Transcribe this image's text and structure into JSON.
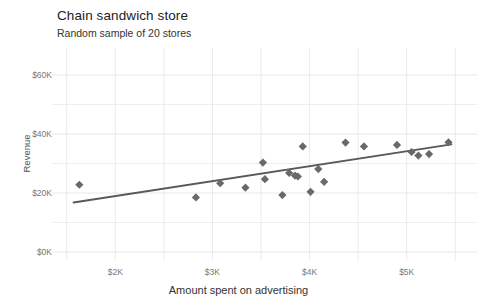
{
  "chart_data": {
    "type": "scatter",
    "title": "Chain sandwich store",
    "subtitle": "Random sample of 20 stores",
    "xlabel": "Amount spent on advertising",
    "ylabel": "Revenue",
    "xlim": [
      1400,
      5600
    ],
    "ylim": [
      0,
      60000
    ],
    "grid": true,
    "legend": false,
    "xticks": [
      2000,
      3000,
      4000,
      5000
    ],
    "xticklabels": [
      "$2K",
      "$3K",
      "$4K",
      "$5K"
    ],
    "yticks": [
      0,
      20000,
      40000,
      60000
    ],
    "yticklabels": [
      "$0K",
      "$20K",
      "$40K",
      "$60K"
    ],
    "marker": "diamond",
    "marker_color": "#696969",
    "line_color": "#595959",
    "grid_color": "#e8e8e8",
    "points": [
      {
        "x": 1630,
        "y": 22800
      },
      {
        "x": 2830,
        "y": 18500
      },
      {
        "x": 3080,
        "y": 23300
      },
      {
        "x": 3340,
        "y": 21800
      },
      {
        "x": 3520,
        "y": 30300
      },
      {
        "x": 3540,
        "y": 24700
      },
      {
        "x": 3720,
        "y": 19300
      },
      {
        "x": 3790,
        "y": 26800
      },
      {
        "x": 3850,
        "y": 25900
      },
      {
        "x": 3880,
        "y": 25600
      },
      {
        "x": 3930,
        "y": 35800
      },
      {
        "x": 4010,
        "y": 20400
      },
      {
        "x": 4090,
        "y": 28100
      },
      {
        "x": 4150,
        "y": 23800
      },
      {
        "x": 4370,
        "y": 37100
      },
      {
        "x": 4560,
        "y": 35800
      },
      {
        "x": 4900,
        "y": 36300
      },
      {
        "x": 5050,
        "y": 33900
      },
      {
        "x": 5120,
        "y": 32700
      },
      {
        "x": 5230,
        "y": 33200
      },
      {
        "x": 5430,
        "y": 37200
      }
    ],
    "trendline": {
      "x_start": 1570,
      "y_start": 16800,
      "x_end": 5460,
      "y_end": 36500
    }
  }
}
